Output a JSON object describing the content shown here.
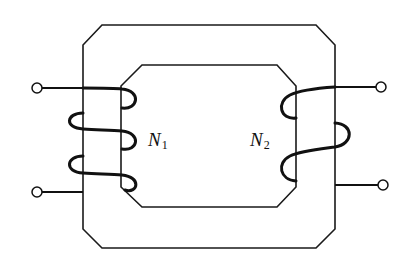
{
  "diagram": {
    "type": "transformer",
    "primary_winding": {
      "label": "N",
      "subscript": "1",
      "turns_drawn": 3,
      "side": "left",
      "terminals": 2
    },
    "secondary_winding": {
      "label": "N",
      "subscript": "2",
      "turns_drawn": 2,
      "side": "right",
      "terminals": 2
    },
    "core": "closed rectangular core with chamfered corners",
    "colors": {
      "line": "#111111",
      "background": "#ffffff"
    }
  }
}
